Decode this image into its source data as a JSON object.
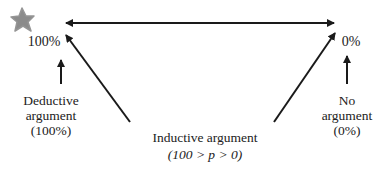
{
  "diagram": {
    "type": "argument-strength-continuum",
    "colors": {
      "line": "#1a1a1a",
      "star": "#7a7a7a",
      "background": "#ffffff"
    },
    "scale": {
      "left_end": "100%",
      "right_end": "0%"
    },
    "nodes": {
      "deductive": {
        "line1": "Deductive",
        "line2": "argument",
        "line3": "(100%)"
      },
      "none": {
        "line1": "No",
        "line2": "argument",
        "line3": "(0%)"
      },
      "inductive": {
        "line1": "Inductive argument",
        "line2": "(100 > p > 0)"
      }
    },
    "icons": {
      "marker": "star-icon"
    }
  }
}
